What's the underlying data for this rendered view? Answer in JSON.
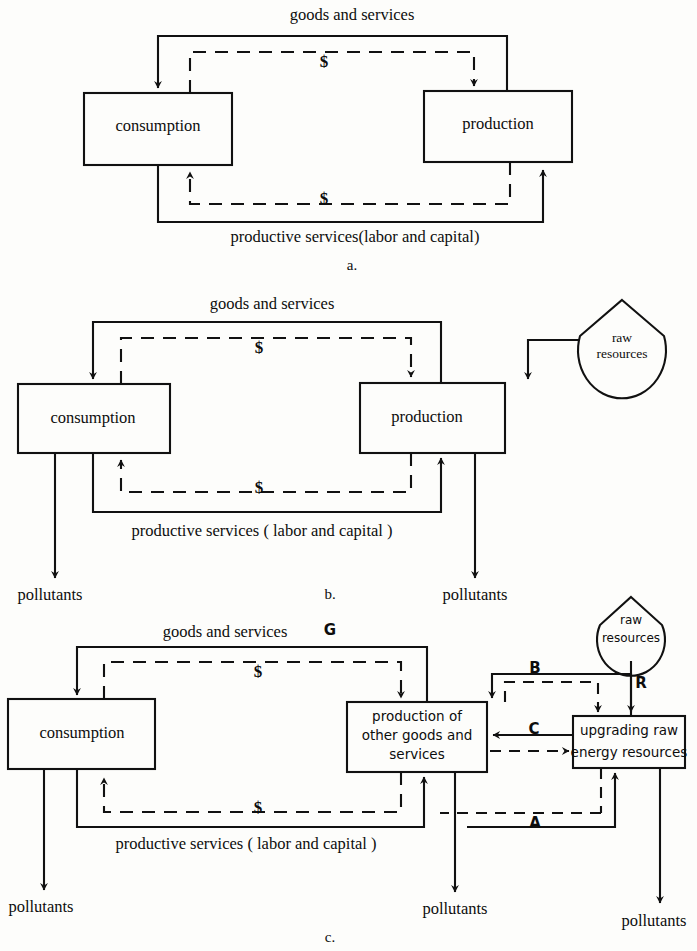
{
  "figure": {
    "panels": [
      {
        "id": "a",
        "caption": "a.",
        "boxes": [
          {
            "name": "consumption",
            "label": "consumption"
          },
          {
            "name": "production",
            "label": "production"
          }
        ],
        "flow_labels": [
          {
            "name": "goods-and-services",
            "text": "goods and services"
          },
          {
            "name": "productive-services",
            "text": "productive services(labor and capital)"
          },
          {
            "name": "dollar-top",
            "text": "$"
          },
          {
            "name": "dollar-bottom",
            "text": "$"
          }
        ]
      },
      {
        "id": "b",
        "caption": "b.",
        "boxes": [
          {
            "name": "consumption",
            "label": "consumption"
          },
          {
            "name": "production",
            "label": "production"
          },
          {
            "name": "raw-resources",
            "label_line1": "raw",
            "label_line2": "resources"
          }
        ],
        "flow_labels": [
          {
            "name": "goods-and-services",
            "text": "goods and services"
          },
          {
            "name": "productive-services",
            "text": "productive services ( labor and capital )"
          },
          {
            "name": "dollar-top",
            "text": "$"
          },
          {
            "name": "dollar-bottom",
            "text": "$"
          }
        ],
        "pollutant_labels": [
          {
            "name": "pollutants-consumption",
            "text": "pollutants"
          },
          {
            "name": "pollutants-production",
            "text": "pollutants"
          }
        ]
      },
      {
        "id": "c",
        "caption": "c.",
        "boxes": [
          {
            "name": "consumption",
            "label": "consumption"
          },
          {
            "name": "production-other-goods",
            "label_line1": "production of",
            "label_line2": "other goods and",
            "label_line3": "services"
          },
          {
            "name": "upgrading-raw-energy",
            "label_line1": "upgrading raw",
            "label_line2": "energy resources"
          },
          {
            "name": "raw-resources",
            "label_line1": "raw",
            "label_line2": "resources"
          }
        ],
        "flow_labels": [
          {
            "name": "goods-and-services",
            "text": "goods and services"
          },
          {
            "name": "goods-flow-symbol-g",
            "text": "G"
          },
          {
            "name": "productive-services",
            "text": "productive services ( labor and capital )"
          },
          {
            "name": "dollar-top",
            "text": "$"
          },
          {
            "name": "dollar-bottom",
            "text": "$"
          },
          {
            "name": "flow-symbol-a",
            "text": "A"
          },
          {
            "name": "flow-symbol-b",
            "text": "B"
          },
          {
            "name": "flow-symbol-c",
            "text": "C"
          },
          {
            "name": "flow-symbol-r",
            "text": "R"
          }
        ],
        "pollutant_labels": [
          {
            "name": "pollutants-consumption",
            "text": "pollutants"
          },
          {
            "name": "pollutants-production",
            "text": "pollutants"
          },
          {
            "name": "pollutants-upgrading",
            "text": "pollutants"
          }
        ]
      }
    ]
  },
  "style": {
    "ink": "#111111",
    "paper": "#fdfdfb"
  }
}
